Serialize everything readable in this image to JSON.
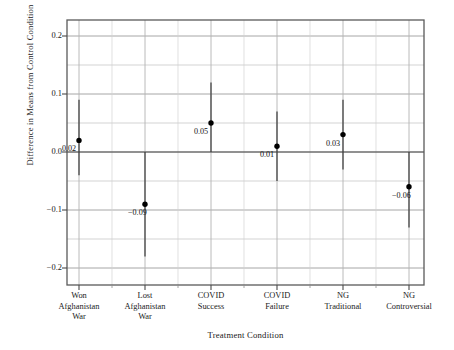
{
  "chart_data": {
    "type": "scatter",
    "title": "",
    "xlabel": "Treatment Condition",
    "ylabel": "Difference in Means from Control Condition",
    "categories": [
      "Won Afghanistan War",
      "Lost Afghanistan War",
      "COVID Success",
      "COVID Failure",
      "NG Traditional",
      "NG Controversial"
    ],
    "category_lines": [
      [
        "Won",
        "Afghanistan",
        "War"
      ],
      [
        "Lost",
        "Afghanistan",
        "War"
      ],
      [
        "COVID",
        "Success",
        ""
      ],
      [
        "COVID",
        "Failure",
        ""
      ],
      [
        "NG",
        "Traditional",
        ""
      ],
      [
        "NG",
        "Controversial",
        ""
      ]
    ],
    "values": [
      0.02,
      -0.09,
      0.05,
      0.01,
      0.03,
      -0.06
    ],
    "value_labels": [
      "0.02",
      "−0.09",
      "0.05",
      "0.01",
      "0.03",
      "−0.06"
    ],
    "ci_lower": [
      -0.04,
      -0.18,
      0.0,
      -0.05,
      -0.03,
      -0.13
    ],
    "ci_upper": [
      0.09,
      0.0,
      0.12,
      0.07,
      0.09,
      0.0
    ],
    "ylim": [
      -0.22,
      0.22
    ],
    "yticks": [
      0.2,
      0.1,
      0.0,
      -0.1,
      -0.2
    ],
    "ytick_labels": [
      "0.2",
      "0.1",
      "0.0",
      "−0.1",
      "−0.2"
    ],
    "y_minor_gridlines": [
      0.15,
      0.05,
      -0.05,
      -0.15
    ],
    "reference_line": 0.0,
    "grid": true,
    "legend": "none",
    "colors": {
      "point": "#000000",
      "errorbar": "#3a3a3a",
      "grid_major": "#9a9a9a",
      "grid_minor": "#c4c4c4",
      "axis": "#555555",
      "reference": "#6a6a6a",
      "background": "#ffffff"
    }
  }
}
